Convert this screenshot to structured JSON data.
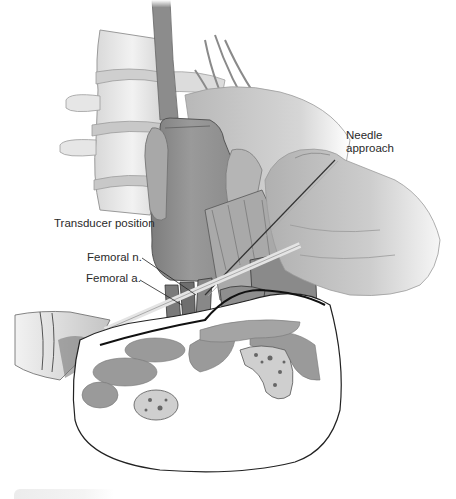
{
  "figure": {
    "labels": {
      "needle_line1": "Needle",
      "needle_line2": "approach",
      "transducer": "Transducer position",
      "femoral_nerve": "Femoral n.",
      "femoral_artery": "Femoral a."
    },
    "structures": [
      "lumbar-spine",
      "transducer",
      "hand-holding-transducer",
      "hand-holding-needle",
      "needle",
      "femoral-nerve",
      "femoral-artery",
      "thigh-cross-section",
      "femur",
      "muscles",
      "fascia-line"
    ],
    "colors": {
      "skin": "#c9c9c9",
      "transducer": "#8f8f8f",
      "muscle": "#9a9a9a",
      "bone": "#cfcfcf",
      "outline": "#222222",
      "text": "#2a2a2a"
    }
  }
}
